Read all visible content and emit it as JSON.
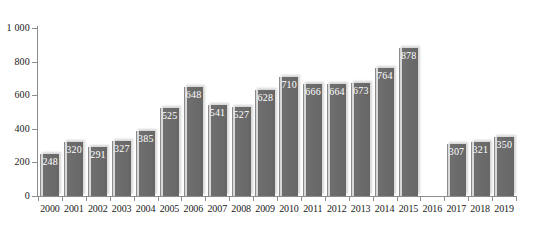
{
  "chart_data": {
    "type": "bar",
    "title": "",
    "subtitle": "",
    "xlabel": "",
    "ylabel": "",
    "categories": [
      "2000",
      "2001",
      "2002",
      "2003",
      "2004",
      "2005",
      "2006",
      "2007",
      "2008",
      "2009",
      "2010",
      "2011",
      "2012",
      "2013",
      "2014",
      "2015",
      "2016",
      "2017",
      "2018",
      "2019"
    ],
    "values": [
      248,
      320,
      291,
      327,
      385,
      525,
      648,
      541,
      527,
      628,
      710,
      666,
      664,
      673,
      764,
      878,
      null,
      307,
      321,
      350
    ],
    "value_labels": [
      "248",
      "320",
      "291",
      "327",
      "385",
      "525",
      "648",
      "541",
      "527",
      "628",
      "710",
      "666",
      "664",
      "673",
      "764",
      "878",
      "",
      "307",
      "321",
      "350"
    ],
    "ylim": [
      0,
      1000
    ],
    "y_ticks": [
      0,
      200,
      400,
      600,
      800,
      1000
    ],
    "y_tick_labels": [
      "0",
      "200",
      "400",
      "600",
      "800",
      "1 000"
    ],
    "grid": false,
    "legend": false,
    "legend_position": "none",
    "bar_color": "#6f6f6f",
    "bar_label_color": "#ffffff",
    "axis_color": "#8d8d8d",
    "background_color": "#ffffff"
  }
}
